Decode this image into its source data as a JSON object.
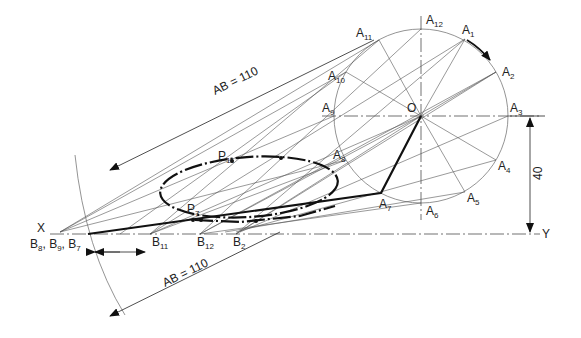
{
  "diagram": {
    "type": "engineering-drawing",
    "circle": {
      "center_label": "O",
      "cx": 421,
      "cy": 116,
      "r": 87
    },
    "circle_points": [
      {
        "base": "A",
        "sub": "1",
        "x": 465,
        "y": 39,
        "lx": 462,
        "ly": 34
      },
      {
        "base": "A",
        "sub": "2",
        "x": 496,
        "y": 72,
        "lx": 502,
        "ly": 76
      },
      {
        "base": "A",
        "sub": "3",
        "x": 508,
        "y": 116,
        "lx": 510,
        "ly": 112
      },
      {
        "base": "A",
        "sub": "4",
        "x": 496,
        "y": 160,
        "lx": 498,
        "ly": 170
      },
      {
        "base": "A",
        "sub": "5",
        "x": 465,
        "y": 192,
        "lx": 467,
        "ly": 202
      },
      {
        "base": "A",
        "sub": "6",
        "x": 421,
        "y": 203,
        "lx": 426,
        "ly": 215
      },
      {
        "base": "A",
        "sub": "7",
        "x": 381,
        "y": 193,
        "lx": 379,
        "ly": 208
      },
      {
        "base": "A",
        "sub": "8",
        "x": 346,
        "y": 160,
        "lx": 333,
        "ly": 159
      },
      {
        "base": "A",
        "sub": "9",
        "x": 334,
        "y": 116,
        "lx": 322,
        "ly": 112
      },
      {
        "base": "A",
        "sub": "10",
        "x": 346,
        "y": 72,
        "lx": 328,
        "ly": 80
      },
      {
        "base": "A",
        "sub": "11",
        "x": 379,
        "y": 40,
        "lx": 356,
        "ly": 37
      },
      {
        "base": "A",
        "sub": "12",
        "x": 421,
        "y": 29,
        "lx": 426,
        "ly": 24
      }
    ],
    "xy_line": {
      "y": 234,
      "x_label": "X",
      "y_label": "Y"
    },
    "b_labels": [
      {
        "text": "B",
        "sub": "8",
        "x": 33,
        "y": 246
      },
      {
        "text": ", B",
        "sub": "9",
        "x": 44,
        "y": 246
      },
      {
        "text": ", B",
        "sub": "7",
        "x": 62,
        "y": 246
      },
      {
        "text": "B",
        "sub": "11",
        "x": 152,
        "y": 246
      },
      {
        "text": "B",
        "sub": "12",
        "x": 197,
        "y": 246
      },
      {
        "text": "B",
        "sub": "2",
        "x": 232,
        "y": 246
      }
    ],
    "p_labels": [
      {
        "text": "P",
        "sub": "11",
        "x": 218,
        "y": 160
      },
      {
        "text": "P",
        "sub": "7",
        "x": 187,
        "y": 213
      }
    ],
    "dimensions": {
      "ab_upper": "AB = 110",
      "ab_lower": "AB = 110",
      "height": "40"
    },
    "center_label": "O"
  }
}
